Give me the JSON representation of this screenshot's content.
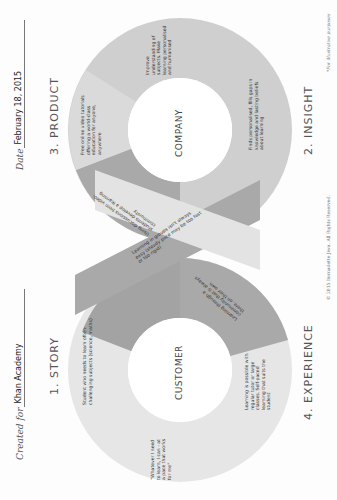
{
  "header": {
    "created_for_label": "Created for",
    "created_for_value": "Khan Academy",
    "date_label": "Date",
    "date_value": "February 18, 2015"
  },
  "steps": [
    {
      "number": "1.",
      "label": "1. STORY"
    },
    {
      "number": "2.",
      "label": "2. INSIGHT"
    },
    {
      "number": "3.",
      "label": "3. PRODUCT"
    },
    {
      "number": "4.",
      "label": "4. EXPERIENCE"
    }
  ],
  "loops": {
    "customer": "CUSTOMER",
    "company": "COMPANY"
  },
  "notes": {
    "story_quote": "\"Whatever I need to learn, I can - at a pace that works for me\"",
    "story_need": "Student who needs to learn often-challenging subjects (science, maths)",
    "insight_finds": "Finds personalised, fills gaps in knowledge and lasting beliefs about learning",
    "insight_improve": "Improve understanding of subjects. Make learning personalised and humanised",
    "product": "Free online video tutorials offering a world-class education for anyone, anywhere",
    "product_discussion": "Using discussions from video, students develop a learning community",
    "crossing": "Learning in groups isn't always easy (steady pace may be too fast or too rigid)",
    "experience_community": "Learning through a community that is always there, on their own",
    "experience_possible": "Learning is possible with regular tutor or large classes. Self-paced learning that suits the student"
  },
  "footer": {
    "copyright": "© 2015 Bernadette Jiwa. All Rights Reserved.",
    "disclaimer": "*For illustrative purposes"
  },
  "colors": {
    "band_light": "#e6e6e6",
    "band_mid": "#cfcfcf",
    "band_dark": "#a9a9a9",
    "band_darker": "#9c9c9c",
    "text": "#333333"
  }
}
